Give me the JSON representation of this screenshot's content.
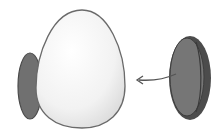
{
  "figure": {
    "colors": {
      "background": "#ffffff",
      "egg_fill": "#f4f4f4",
      "egg_outline": "#6a6a6a",
      "disc_fill": "#6e6e6e",
      "disc_rim": "#4a4a4a",
      "arrow": "#555555"
    },
    "elements": [
      {
        "id": "egg",
        "label": ""
      },
      {
        "id": "disc-behind-egg",
        "label": ""
      },
      {
        "id": "disc-right",
        "label": ""
      },
      {
        "id": "arrow",
        "label": ""
      }
    ]
  }
}
